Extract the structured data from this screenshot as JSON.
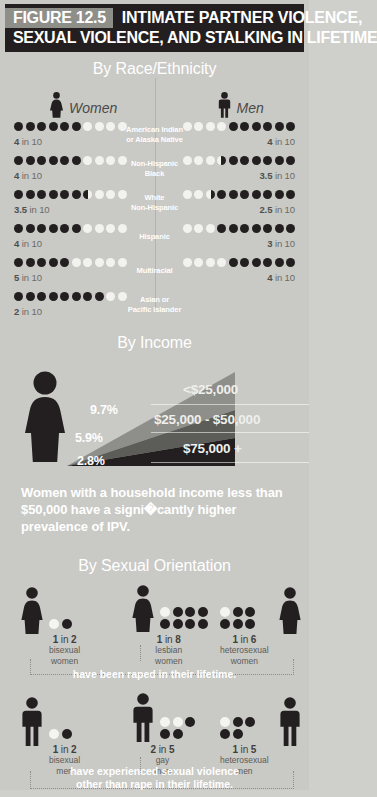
{
  "header": {
    "figure_tag": "FIGURE 12.5",
    "title_line1": "INTIMATE PARTNER VIOLENCE,",
    "title_line2": "SEXUAL VIOLENCE, AND STALKING IN LIFETIME",
    "bg_color": "#231f20",
    "tag_bg_color": "#8f8f8a"
  },
  "race_section": {
    "title": "By Race/Ethnicity",
    "women_label": "Women",
    "men_label": "Men",
    "groups": [
      {
        "label": "American Indian\nor Alaska Native",
        "women_ratio": "4",
        "women_unit": "in 10",
        "men_ratio": "4",
        "men_unit": "in 10",
        "women_value": 4,
        "men_value": 4
      },
      {
        "label": "Non-Hispanic\nBlack",
        "women_ratio": "4",
        "women_unit": "in 10",
        "men_ratio": "3.5",
        "men_unit": "in 10",
        "women_value": 4,
        "men_value": 3.5
      },
      {
        "label": "White\nNon-Hispanic",
        "women_ratio": "3.5",
        "women_unit": "in 10",
        "men_ratio": "2.5",
        "men_unit": "in 10",
        "women_value": 3.5,
        "men_value": 2.5
      },
      {
        "label": "Hispanic",
        "women_ratio": "4",
        "women_unit": "in 10",
        "men_ratio": "3",
        "men_unit": "in 10",
        "women_value": 4,
        "men_value": 3
      },
      {
        "label": "Multiracial",
        "women_ratio": "5",
        "women_unit": "in 10",
        "men_ratio": "4",
        "men_unit": "in 10",
        "women_value": 5,
        "men_value": 4
      },
      {
        "label": "Asian or\nPacific Islander",
        "women_ratio": "2",
        "women_unit": "in 10",
        "men_ratio": "",
        "men_unit": "",
        "women_value": 2,
        "men_value": 0
      }
    ],
    "dots_per_row": 10,
    "dot_filled_color": "#f2f2ef",
    "dot_empty_color": "#231f20"
  },
  "income_section": {
    "title": "By Income",
    "bands": [
      {
        "percent": "9.7%",
        "bracket": "<$25,000",
        "value": 9.7
      },
      {
        "percent": "5.9%",
        "bracket": "$25,000 - $50,000",
        "value": 5.9
      },
      {
        "percent": "2.8%",
        "bracket": "$75,000 +",
        "value": 2.8
      }
    ],
    "statement": "Women with a household income less than $50,000 have a signi�cantly higher prevalence of IPV."
  },
  "orientation_section": {
    "title": "By Sexual Orientation",
    "women_row": {
      "caption": "have been raped in their lifetime.",
      "groups": [
        {
          "ratio_num": "1",
          "ratio_in": "in",
          "ratio_den": "2",
          "caption_line1": "bisexual",
          "caption_line2": "women",
          "total": 2,
          "filled": 1,
          "per_line": 2
        },
        {
          "ratio_num": "1",
          "ratio_in": "in",
          "ratio_den": "8",
          "caption_line1": "lesbian",
          "caption_line2": "women",
          "total": 8,
          "filled": 1,
          "per_line": 4
        },
        {
          "ratio_num": "1",
          "ratio_in": "in",
          "ratio_den": "6",
          "caption_line1": "heterosexual",
          "caption_line2": "women",
          "total": 6,
          "filled": 1,
          "per_line": 3
        }
      ]
    },
    "men_row": {
      "caption_line1": "have experienced sexual violence",
      "caption_line2": "other than rape in their lifetime.",
      "groups": [
        {
          "ratio_num": "1",
          "ratio_in": "in",
          "ratio_den": "2",
          "caption_line1": "bisexual",
          "caption_line2": "men",
          "total": 2,
          "filled": 1,
          "per_line": 2
        },
        {
          "ratio_num": "2",
          "ratio_in": "in",
          "ratio_den": "5",
          "caption_line1": "gay",
          "caption_line2": "men",
          "total": 5,
          "filled": 2,
          "per_line": 3
        },
        {
          "ratio_num": "1",
          "ratio_in": "in",
          "ratio_den": "5",
          "caption_line1": "heterosexual",
          "caption_line2": "men",
          "total": 5,
          "filled": 1,
          "per_line": 3
        }
      ]
    }
  },
  "chart_data": {
    "type": "bar",
    "title": "Intimate Partner Violence, Sexual Violence, and Stalking in Lifetime",
    "charts": [
      {
        "type": "bar",
        "title": "By Race/Ethnicity",
        "ylabel": "Number in 10",
        "categories": [
          "American Indian or Alaska Native",
          "Non-Hispanic Black",
          "White Non-Hispanic",
          "Hispanic",
          "Multiracial",
          "Asian or Pacific Islander"
        ],
        "series": [
          {
            "name": "Women",
            "values": [
              4,
              4,
              3.5,
              4,
              5,
              2
            ]
          },
          {
            "name": "Men",
            "values": [
              4,
              3.5,
              2.5,
              3,
              4,
              null
            ]
          }
        ],
        "ylim": [
          0,
          10
        ]
      },
      {
        "type": "bar",
        "title": "By Income",
        "categories": [
          "<$25,000",
          "$25,000 - $50,000",
          "$75,000 +"
        ],
        "values": [
          9.7,
          5.9,
          2.8
        ],
        "ylabel": "Prevalence (%)",
        "ylim": [
          0,
          10
        ]
      },
      {
        "type": "bar",
        "title": "By Sexual Orientation - Raped in lifetime (women)",
        "categories": [
          "bisexual women",
          "lesbian women",
          "heterosexual women"
        ],
        "values": [
          50,
          12.5,
          16.7
        ],
        "ylabel": "Percent",
        "annotations": [
          "1 in 2",
          "1 in 8",
          "1 in 6"
        ]
      },
      {
        "type": "bar",
        "title": "By Sexual Orientation - Sexual violence other than rape (men)",
        "categories": [
          "bisexual men",
          "gay men",
          "heterosexual men"
        ],
        "values": [
          50,
          40,
          20
        ],
        "ylabel": "Percent",
        "annotations": [
          "1 in 2",
          "2 in 5",
          "1 in 5"
        ]
      }
    ]
  }
}
